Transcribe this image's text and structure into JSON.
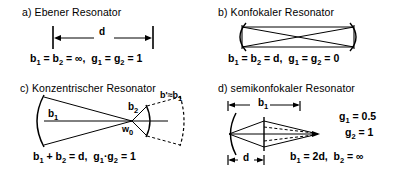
{
  "figure": {
    "panels": [
      {
        "id": "plane",
        "title": "a)  Ebener  Resonator",
        "dimension_label": "d",
        "formula_parts": [
          "b",
          "1",
          " = b",
          "2",
          " = ∞,  g",
          "1",
          " = g",
          "2",
          " = 1"
        ],
        "formula_text": "b₁ = b₂ = ∞,  g₁ = g₂ = 1"
      },
      {
        "id": "confocal",
        "title": "b)  Konfokaler  Resonator",
        "formula_text": "b₁ = b₂ = d,  g₁ = g₂ = 0"
      },
      {
        "id": "concentric",
        "title": "c)  Konzentrischer  Resonator",
        "labels": {
          "b1": "b",
          "b1_sub": "1",
          "b2": "b",
          "b2_sub": "2",
          "waist": "w",
          "waist_sub": "0",
          "bprime": "b' ≈ b",
          "bprime_sub": "1"
        },
        "formula_text": "b₁ + b₂ = d,  g₁·g₂ = 1"
      },
      {
        "id": "semiconfocal",
        "title": "d)  semikonfokaler  Resonator",
        "dimension_top": "b",
        "dimension_top_sub": "1",
        "dimension_bottom": "d",
        "conditions": [
          {
            "sym": "g",
            "sub": "1",
            "val": " = 0.5"
          },
          {
            "sym": "g",
            "sub": "2",
            "val": " = 1"
          }
        ],
        "formula_text": "b₁ = 2d,  b₂ = ∞"
      }
    ],
    "colors": {
      "ink": "#000000",
      "background": "#ffffff"
    }
  }
}
